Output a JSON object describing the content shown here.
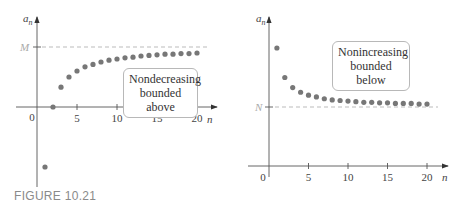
{
  "caption": "FIGURE 10.21",
  "colors": {
    "point": "#777777",
    "axis": "#555555",
    "bound_line": "#aaaaaa"
  },
  "chart_data": [
    {
      "type": "scatter",
      "title": "",
      "xlabel": "n",
      "ylabel": "a_n",
      "x_ticks": [
        5,
        10,
        15,
        20
      ],
      "origin_label": "0",
      "bound_label": "M",
      "bound_type": "upper",
      "annotation": [
        "Nondecreasing",
        "bounded above"
      ],
      "x": [
        1,
        2,
        3,
        4,
        5,
        6,
        7,
        8,
        9,
        10,
        11,
        12,
        13,
        14,
        15,
        16,
        17,
        18,
        19,
        20
      ],
      "values": [
        -1.0,
        0.0,
        0.33,
        0.5,
        0.6,
        0.67,
        0.71,
        0.75,
        0.78,
        0.8,
        0.82,
        0.83,
        0.85,
        0.86,
        0.87,
        0.88,
        0.88,
        0.89,
        0.89,
        0.9
      ],
      "bound_value": 1.0,
      "grid": false
    },
    {
      "type": "scatter",
      "title": "",
      "xlabel": "n",
      "ylabel": "a_n",
      "x_ticks": [
        5,
        10,
        15,
        20
      ],
      "origin_label": "0",
      "bound_label": "N",
      "bound_type": "lower",
      "annotation": [
        "Nonincreasing",
        "bounded below"
      ],
      "x": [
        1,
        2,
        3,
        4,
        5,
        6,
        7,
        8,
        9,
        10,
        11,
        12,
        13,
        14,
        15,
        16,
        17,
        18,
        19,
        20
      ],
      "values": [
        2.0,
        1.5,
        1.33,
        1.25,
        1.2,
        1.17,
        1.14,
        1.12,
        1.11,
        1.1,
        1.09,
        1.08,
        1.08,
        1.07,
        1.07,
        1.06,
        1.06,
        1.06,
        1.05,
        1.05
      ],
      "bound_value": 1.0,
      "grid": false
    }
  ]
}
